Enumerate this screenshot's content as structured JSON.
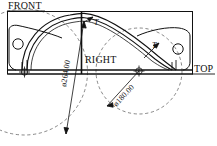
{
  "drawing": {
    "title": "Arch bracket orthographic drawing",
    "view_labels": [
      {
        "name": "front",
        "text": "FRONT"
      },
      {
        "name": "right",
        "text": "RIGHT"
      },
      {
        "name": "top",
        "text": "TOP"
      }
    ],
    "dimensions": [
      {
        "name": "large-diameter",
        "text": "ø264.00",
        "value": 264.0,
        "symbol": "ø"
      },
      {
        "name": "small-diameter",
        "text": "ø180.00",
        "value": 180.0,
        "symbol": "ø"
      }
    ],
    "tangent_marks": [
      {
        "name": "tangent-left",
        "text": "T"
      },
      {
        "name": "tangent-right",
        "text": "T"
      }
    ],
    "colors": {
      "line": "#111111",
      "construction": "#555555",
      "background": "#ffffff"
    }
  }
}
